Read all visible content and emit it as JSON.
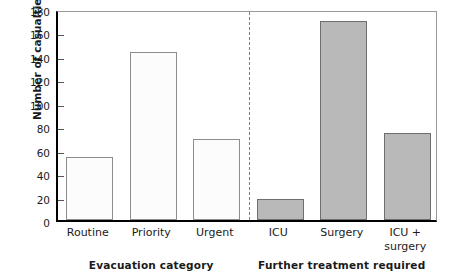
{
  "chart_data": {
    "type": "bar",
    "title": "",
    "subtitle": "",
    "xlabel": "",
    "ylabel": "Number of casualties",
    "ylim": [
      0,
      180
    ],
    "ytick_step": 20,
    "yticks": [
      180,
      160,
      140,
      120,
      100,
      80,
      60,
      40,
      20,
      0
    ],
    "grid": false,
    "legend": "none",
    "categories": [
      "Routine",
      "Priority",
      "Urgent",
      "ICU",
      "Surgery",
      "ICU + surgery"
    ],
    "values": [
      54,
      143,
      69,
      18,
      170,
      74
    ],
    "groups": [
      {
        "label": "Evacuation category",
        "categories": [
          "Routine",
          "Priority",
          "Urgent"
        ],
        "values": [
          54,
          143,
          69
        ],
        "bar_style": "light",
        "fill_color": "#fcfcfc",
        "edge_color": "#8d8d8d"
      },
      {
        "label": "Further treatment required",
        "categories": [
          "ICU",
          "Surgery",
          "ICU + surgery"
        ],
        "values": [
          18,
          170,
          74
        ],
        "bar_style": "dark",
        "fill_color": "#b9b9b9",
        "edge_color": "#6e6e6e"
      }
    ],
    "divider": {
      "style": "dashed",
      "orientation": "vertical",
      "color": "#7d7d7d",
      "between": [
        "Urgent",
        "ICU"
      ]
    },
    "axis_color": "#000000",
    "frame_color": "#9a9a9a",
    "background": "#ffffff"
  },
  "bar_labels": [
    "Routine",
    "Priority",
    "Urgent",
    "ICU",
    "Surgery",
    "ICU +\nsurgery"
  ],
  "group_titles": {
    "left": "Evacuation category",
    "right": "Further treatment required"
  },
  "axis": {
    "y_title": "Number of casualties"
  }
}
